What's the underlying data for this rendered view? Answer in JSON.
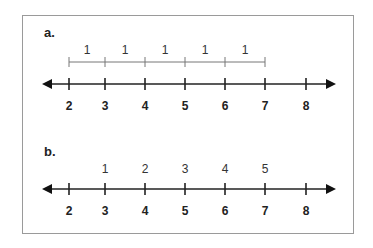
{
  "panels": [
    {
      "label": "a.",
      "number_line": {
        "ticks": [
          "2",
          "3",
          "4",
          "5",
          "6",
          "7",
          "8"
        ]
      },
      "bracket_segments": [
        "1",
        "1",
        "1",
        "1",
        "1"
      ]
    },
    {
      "label": "b.",
      "number_line": {
        "ticks": [
          "2",
          "3",
          "4",
          "5",
          "6",
          "7",
          "8"
        ]
      },
      "count_labels": [
        "1",
        "2",
        "3",
        "4",
        "5"
      ]
    }
  ],
  "colors": {
    "line": "#222222",
    "bracket": "#777777",
    "border": "#9a9a9a"
  }
}
